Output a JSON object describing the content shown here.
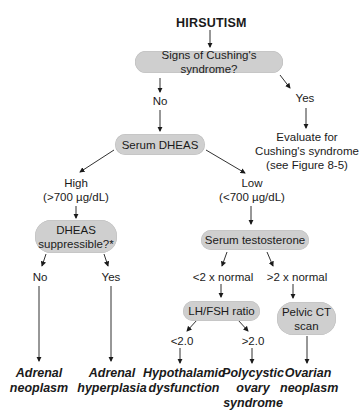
{
  "diagram": {
    "title": "HIRSUTISM",
    "nodes": {
      "cushing_question": "Signs of Cushing's syndrome?",
      "serum_dheas": "Serum DHEAS",
      "dheas_suppressible": "DHEAS\nsuppressible?*",
      "serum_testosterone": "Serum  testosterone",
      "lh_fsh_ratio": "LH/FSH ratio",
      "pelvic_ct": "Pelvic CT\nscan"
    },
    "edge_labels": {
      "cushing_no": "No",
      "cushing_yes": "Yes",
      "dheas_high": "High\n(>700 µg/dL)",
      "dheas_low": "Low\n(<700 µg/dL)",
      "suppressible_no": "No",
      "suppressible_yes": "Yes",
      "testosterone_low": "<2 x normal",
      "testosterone_high": ">2 x normal",
      "ratio_low": "<2.0",
      "ratio_high": ">2.0"
    },
    "outcomes": {
      "evaluate_cushing": "Evaluate for\nCushing's syndrome\n(see Figure 8-5)",
      "adrenal_neoplasm": "Adrenal\nneoplasm",
      "adrenal_hyperplasia": "Adrenal\nhyperplasia",
      "hypothalamic_dysfunction": "Hypothalamic\ndysfunction",
      "polycystic_ovary_syndrome": "Polycystic\novary\nsyndrome",
      "ovarian_neoplasm": "Ovarian\nneoplasm"
    },
    "colors": {
      "node_fill": "#cfcfcf",
      "line": "#1a1a1a",
      "background": "#ffffff"
    }
  }
}
